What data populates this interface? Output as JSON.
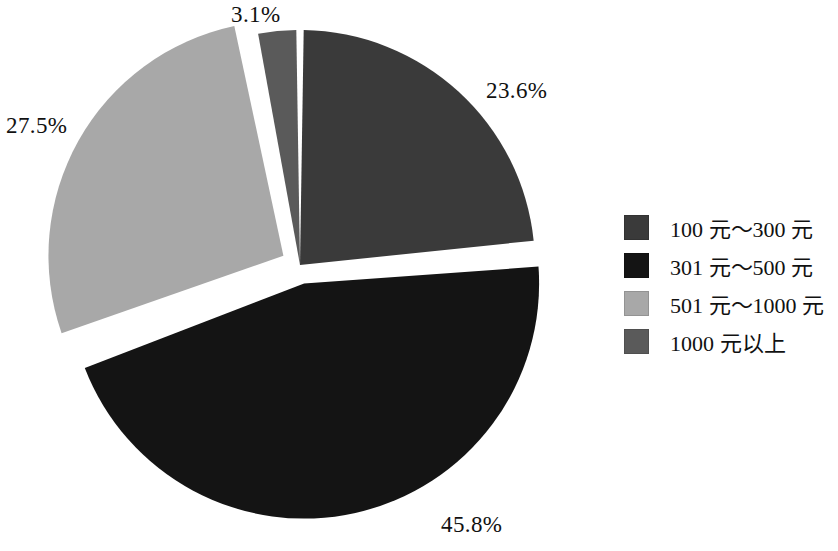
{
  "chart_data": {
    "type": "pie",
    "title": "",
    "subtitle": "",
    "xlabel": "",
    "ylabel": "",
    "grid": false,
    "legend_position": "right",
    "exploded": true,
    "start_angle_deg": 0,
    "direction": "clockwise",
    "categories": [
      "100 元～300 元",
      "301 元～500 元",
      "501 元～1000 元",
      "1000 元以上"
    ],
    "values": [
      23.6,
      45.8,
      27.5,
      3.1
    ],
    "value_labels": [
      "23.6%",
      "45.8%",
      "27.5%",
      "3.1%"
    ],
    "colors": [
      "#3a3a3a",
      "#141414",
      "#a8a8a8",
      "#5a5a5a"
    ],
    "slices": [
      {
        "label": "100 元～300 元",
        "value": 23.6,
        "value_label": "23.6%",
        "color": "#3a3a3a",
        "exploded": false
      },
      {
        "label": "301 元～500 元",
        "value": 45.8,
        "value_label": "45.8%",
        "color": "#141414",
        "exploded": true
      },
      {
        "label": "501 元～1000 元",
        "value": 27.5,
        "value_label": "27.5%",
        "color": "#a8a8a8",
        "exploded": true
      },
      {
        "label": "1000 元以上",
        "value": 3.1,
        "value_label": "3.1%",
        "color": "#5a5a5a",
        "exploded": false
      }
    ]
  },
  "labels": {
    "top": "3.1%",
    "right": "23.6%",
    "left": "27.5%",
    "bottom": "45.8%"
  },
  "legend": {
    "items": [
      {
        "label": "100 元～300 元",
        "color": "#3a3a3a"
      },
      {
        "label": "301 元～500 元",
        "color": "#141414"
      },
      {
        "label": "501 元～1000 元",
        "color": "#a8a8a8"
      },
      {
        "label": "1000 元以上",
        "color": "#5a5a5a"
      }
    ]
  },
  "style": {
    "background": "#ffffff",
    "text_color": "#111111"
  }
}
